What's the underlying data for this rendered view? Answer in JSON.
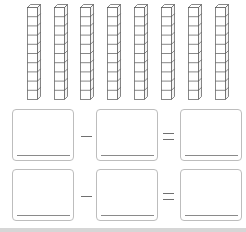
{
  "worksheet": {
    "tens_rods": {
      "count": 8,
      "cubes_per_rod": 10,
      "positions_x": [
        27,
        54,
        80,
        107,
        134,
        161,
        188,
        215
      ]
    },
    "equations": [
      {
        "left": "",
        "operator": "−",
        "right": "",
        "equals": "=",
        "result": ""
      },
      {
        "left": "",
        "operator": "−",
        "right": "",
        "equals": "=",
        "result": ""
      }
    ]
  },
  "colors": {
    "rod_stroke": "#555555",
    "box_border": "#bdbdbd",
    "footer": "#d6d6d6"
  }
}
